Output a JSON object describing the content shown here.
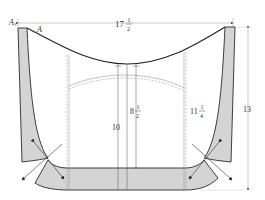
{
  "diagram": {
    "type": "sewing-pattern",
    "colors": {
      "line": "#2a2a2a",
      "shade": "#d4d4d4",
      "dim_line": "#9a9a9a",
      "dashed": "#8a8a8a"
    },
    "labels": {
      "point_a1": "A",
      "point_a1_sub": "1",
      "point_a": "A",
      "width_whole": "17",
      "width_num": "1",
      "width_den": "2",
      "height_total": "13",
      "center_height": "10",
      "inner_whole": "8",
      "inner_num": "1",
      "inner_den": "2",
      "side_whole": "11",
      "side_num": "1",
      "side_den": "4"
    }
  }
}
